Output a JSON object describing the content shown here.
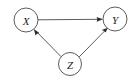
{
  "figure": {
    "kind": "directed-acyclic-graph",
    "background_color": "#ffffff",
    "stroke_color": "#4a4a4a",
    "arrow_color": "#2b2b2b",
    "label_color": "#1c1c1c",
    "width": 139,
    "height": 82
  },
  "nodes": [
    {
      "id": "X",
      "label": "X",
      "cx": 26,
      "cy": 20,
      "r": 12
    },
    {
      "id": "Y",
      "label": "Y",
      "cx": 115,
      "cy": 19,
      "r": 12
    },
    {
      "id": "Z",
      "label": "Z",
      "cx": 70,
      "cy": 64,
      "r": 11.5
    }
  ],
  "edges": [
    {
      "id": "x-to-y",
      "from": "X",
      "to": "Y",
      "arrow": "to",
      "style": "straight"
    },
    {
      "id": "z-to-x",
      "from": "Z",
      "to": "X",
      "arrow": "to",
      "style": "straight"
    },
    {
      "id": "z-to-y",
      "from": "Z",
      "to": "Y",
      "arrow": "to",
      "style": "straight"
    }
  ]
}
